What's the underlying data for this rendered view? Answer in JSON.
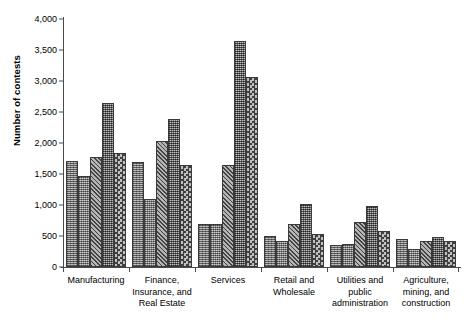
{
  "axes": {
    "ylabel": "Number of contests",
    "yticks": [
      "0",
      "500",
      "1,000",
      "1,500",
      "2,000",
      "2,500",
      "3,000",
      "3,500",
      "4,000"
    ]
  },
  "chart_data": {
    "type": "bar",
    "title": "",
    "xlabel": "",
    "ylabel": "Number of contests",
    "ylim": [
      0,
      4000
    ],
    "ytick_values": [
      0,
      500,
      1000,
      1500,
      2000,
      2500,
      3000,
      3500,
      4000
    ],
    "grid": false,
    "legend": "none",
    "categories": [
      "Manufacturing",
      "Finance, Insurance, and Real Estate",
      "Services",
      "Retail and Wholesale",
      "Utilities and public administration",
      "Agriculture, mining, and construction"
    ],
    "series": [
      {
        "name": "Series 1",
        "pattern": "vertical-fine",
        "values": [
          1710,
          1700,
          690,
          500,
          350,
          450
        ]
      },
      {
        "name": "Series 2",
        "pattern": "dotted-fine",
        "values": [
          1460,
          1090,
          690,
          420,
          370,
          290
        ]
      },
      {
        "name": "Series 3",
        "pattern": "diagonal-hatch",
        "values": [
          1770,
          2030,
          1640,
          690,
          730,
          420
        ]
      },
      {
        "name": "Series 4",
        "pattern": "fine-grid",
        "values": [
          2650,
          2390,
          3650,
          1020,
          980,
          480
        ]
      },
      {
        "name": "Series 5",
        "pattern": "checkerboard",
        "values": [
          1840,
          1650,
          3060,
          530,
          580,
          420
        ]
      }
    ]
  },
  "category_labels": [
    "Manufacturing",
    "Finance,\nInsurance, and\nReal Estate",
    "Services",
    "Retail and\nWholesale",
    "Utilities and\npublic\nadministration",
    "Agriculture,\nmining, and\nconstruction"
  ]
}
